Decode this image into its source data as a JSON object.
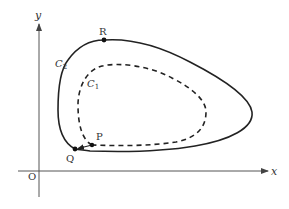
{
  "diagram": {
    "axes": {
      "x_label": "x",
      "y_label": "y",
      "origin_label": "O"
    },
    "curves": [
      {
        "name": "C",
        "subscript": "2",
        "style": "solid"
      },
      {
        "name": "C",
        "subscript": "1",
        "style": "dashed"
      }
    ],
    "points": [
      {
        "label": "R"
      },
      {
        "label": "P"
      },
      {
        "label": "Q"
      }
    ],
    "colors": {
      "stroke": "#222222",
      "axis": "#555555",
      "text": "#333333"
    }
  }
}
